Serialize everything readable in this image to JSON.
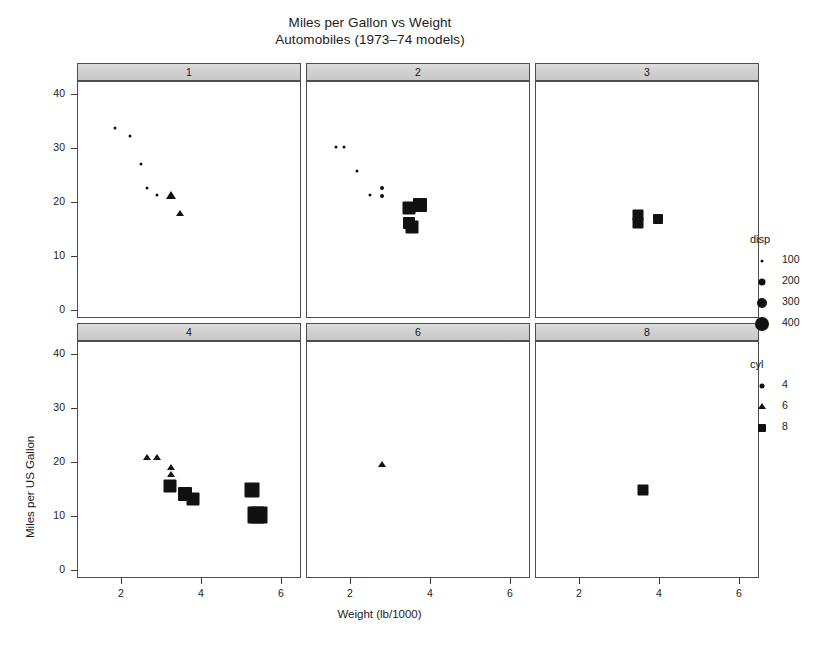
{
  "chart_data": {
    "type": "scatter",
    "title": "Miles per Gallon vs Weight",
    "subtitle": "Automobiles (1973–74 models)",
    "xlabel": "Weight (lb/1000)",
    "ylabel": "Miles per US Gallon",
    "xlim": [
      0.9,
      6.5
    ],
    "ylim": [
      -1.5,
      42.5
    ],
    "xticks": [
      "2",
      "4",
      "6"
    ],
    "xtick_values": [
      2,
      4,
      6
    ],
    "yticks": [
      "0",
      "10",
      "20",
      "30",
      "40"
    ],
    "ytick_values": [
      0,
      10,
      20,
      30,
      40
    ],
    "grid": false,
    "layout": "3 columns x 2 rows of conditioned panels",
    "panel_variable": "carb",
    "size_variable": "disp",
    "shape_variable": "cyl",
    "legend_position": "right",
    "panels": [
      {
        "strip_label": "1",
        "row": 0,
        "col": 0,
        "points": [
          {
            "x": 1.835,
            "y": 33.9,
            "cyl": 4,
            "disp": 71.1,
            "shape": "circle",
            "size": 3
          },
          {
            "x": 2.2,
            "y": 32.4,
            "cyl": 4,
            "disp": 78.7,
            "shape": "circle",
            "size": 3
          },
          {
            "x": 2.465,
            "y": 27.3,
            "cyl": 4,
            "disp": 79.0,
            "shape": "circle",
            "size": 3
          },
          {
            "x": 2.62,
            "y": 22.8,
            "cyl": 4,
            "disp": 108.0,
            "shape": "circle",
            "size": 3
          },
          {
            "x": 2.875,
            "y": 21.5,
            "cyl": 4,
            "disp": 120.1,
            "shape": "circle",
            "size": 3
          },
          {
            "x": 3.215,
            "y": 21.4,
            "cyl": 6,
            "disp": 258.0,
            "shape": "triangle",
            "size": 7
          },
          {
            "x": 3.46,
            "y": 18.1,
            "cyl": 6,
            "disp": 225.0,
            "shape": "triangle",
            "size": 6
          }
        ]
      },
      {
        "strip_label": "2",
        "row": 0,
        "col": 1,
        "points": [
          {
            "x": 1.615,
            "y": 30.4,
            "cyl": 4,
            "disp": 75.7,
            "shape": "circle",
            "size": 3
          },
          {
            "x": 1.835,
            "y": 30.4,
            "cyl": 4,
            "disp": 95.1,
            "shape": "circle",
            "size": 3
          },
          {
            "x": 2.14,
            "y": 26.0,
            "cyl": 4,
            "disp": 120.3,
            "shape": "circle",
            "size": 3
          },
          {
            "x": 2.77,
            "y": 22.8,
            "cyl": 4,
            "disp": 140.8,
            "shape": "circle",
            "size": 4
          },
          {
            "x": 2.78,
            "y": 21.4,
            "cyl": 4,
            "disp": 121.0,
            "shape": "circle",
            "size": 4
          },
          {
            "x": 2.465,
            "y": 21.5,
            "cyl": 4,
            "disp": 120.1,
            "shape": "circle",
            "size": 3
          },
          {
            "x": 3.44,
            "y": 19.2,
            "cyl": 8,
            "disp": 304.0,
            "shape": "square",
            "size": 13
          },
          {
            "x": 3.73,
            "y": 19.7,
            "cyl": 8,
            "disp": 360.0,
            "shape": "square",
            "size": 14
          },
          {
            "x": 3.44,
            "y": 16.4,
            "cyl": 8,
            "disp": 275.8,
            "shape": "square",
            "size": 12
          },
          {
            "x": 3.52,
            "y": 15.5,
            "cyl": 8,
            "disp": 318.0,
            "shape": "square",
            "size": 13
          }
        ]
      },
      {
        "strip_label": "3",
        "row": 0,
        "col": 2,
        "points": [
          {
            "x": 3.44,
            "y": 17.8,
            "cyl": 8,
            "disp": 275.8,
            "shape": "square",
            "size": 11
          },
          {
            "x": 3.44,
            "y": 16.4,
            "cyl": 8,
            "disp": 275.8,
            "shape": "square",
            "size": 11
          },
          {
            "x": 3.94,
            "y": 17.0,
            "cyl": 8,
            "disp": 275.8,
            "shape": "square",
            "size": 10
          }
        ]
      },
      {
        "strip_label": "4",
        "row": 1,
        "col": 0,
        "points": [
          {
            "x": 2.62,
            "y": 21.0,
            "cyl": 6,
            "disp": 160.0,
            "shape": "triangle",
            "size": 6
          },
          {
            "x": 2.875,
            "y": 21.0,
            "cyl": 6,
            "disp": 160.0,
            "shape": "triangle",
            "size": 6
          },
          {
            "x": 3.215,
            "y": 19.2,
            "cyl": 6,
            "disp": 167.6,
            "shape": "triangle",
            "size": 6
          },
          {
            "x": 3.215,
            "y": 17.8,
            "cyl": 6,
            "disp": 167.6,
            "shape": "triangle",
            "size": 6
          },
          {
            "x": 3.19,
            "y": 15.8,
            "cyl": 8,
            "disp": 351.0,
            "shape": "square",
            "size": 13
          },
          {
            "x": 3.57,
            "y": 14.3,
            "cyl": 8,
            "disp": 360.0,
            "shape": "square",
            "size": 14
          },
          {
            "x": 3.78,
            "y": 13.3,
            "cyl": 8,
            "disp": 350.0,
            "shape": "square",
            "size": 13
          },
          {
            "x": 5.25,
            "y": 15.0,
            "cyl": 8,
            "disp": 400.0,
            "shape": "square",
            "size": 15
          },
          {
            "x": 5.345,
            "y": 10.4,
            "cyl": 8,
            "disp": 472.0,
            "shape": "square",
            "size": 17
          },
          {
            "x": 5.424,
            "y": 10.4,
            "cyl": 8,
            "disp": 460.0,
            "shape": "square",
            "size": 17
          }
        ]
      },
      {
        "strip_label": "6",
        "row": 1,
        "col": 1,
        "points": [
          {
            "x": 2.77,
            "y": 19.7,
            "cyl": 6,
            "disp": 145.0,
            "shape": "triangle",
            "size": 6
          }
        ]
      },
      {
        "strip_label": "8",
        "row": 1,
        "col": 2,
        "points": [
          {
            "x": 3.57,
            "y": 15.0,
            "cyl": 8,
            "disp": 301.0,
            "shape": "square",
            "size": 11
          }
        ]
      }
    ],
    "legends": [
      {
        "title": "disp",
        "name": "disp-legend",
        "entries": [
          {
            "label": "100",
            "shape": "circle",
            "size": 3
          },
          {
            "label": "200",
            "shape": "circle",
            "size": 7
          },
          {
            "label": "300",
            "shape": "circle",
            "size": 10
          },
          {
            "label": "400",
            "shape": "circle",
            "size": 14
          }
        ]
      },
      {
        "title": "cyl",
        "name": "cyl-legend",
        "entries": [
          {
            "label": "4",
            "shape": "circle",
            "size": 5
          },
          {
            "label": "6",
            "shape": "triangle",
            "size": 6
          },
          {
            "label": "8",
            "shape": "square",
            "size": 8
          }
        ]
      }
    ],
    "colors": {
      "point": "#111111",
      "strip_background": "#d4d4d4",
      "panel_border": "#4d4d4d",
      "axis": "#3a3a3a",
      "text": "#1c1c1c",
      "background": "#ffffff"
    }
  }
}
